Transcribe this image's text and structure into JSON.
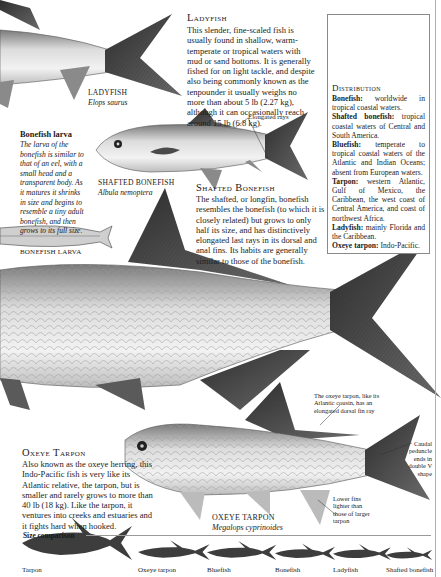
{
  "ladyfish": {
    "heading": "Ladyfish",
    "body": "This slender, fine-scaled fish is usually found in shallow, warm-temperate or tropical waters with mud or sand bottoms. It is generally fished for on light tackle, and despite also being commonly known as the tenpounder it usually weighs no more than about 5 lb (2.27 kg), although it can occasionally reach around 15 lb (6.8 kg).",
    "label": "LADYFISH",
    "scientific": "Elops saurus"
  },
  "bonefish_larva": {
    "heading": "Bonefish larva",
    "body": "The larva of the bonefish is similar to that of an eel, with a small head and a transparent body. As it matures it shrinks in size and begins to resemble a tiny adult bonefish, and then grows to its full size.",
    "label": "BONEFISH LARVA"
  },
  "shafted_bonefish": {
    "label": "SHAFTED BONEFISH",
    "scientific": "Albula nemoptera",
    "callout": "Elongated rays",
    "heading": "Shafted Bonefish",
    "body": "The shafted, or longfin, bonefish resembles the bonefish (to which it is closely related) but grows to only half its size, and has distinctively elongated last rays in its dorsal and anal fins. Its habits are generally similar to those of the bonefish."
  },
  "distribution": {
    "heading": "Distribution",
    "items": [
      {
        "name": "Bonefish:",
        "text": "worldwide in tropical coastal waters."
      },
      {
        "name": "Shafted bonefish:",
        "text": "tropical coastal waters of Central and South America."
      },
      {
        "name": "Bluefish:",
        "text": "temperate to tropical coastal waters of the Atlantic and Indian Oceans; absent from European waters."
      },
      {
        "name": "Tarpon:",
        "text": "western Atlantic, Gulf of Mexico, the Caribbean, the west coast of Central America, and coast of northwest Africa."
      },
      {
        "name": "Ladyfish:",
        "text": "mainly Florida and the Caribbean."
      },
      {
        "name": "Oxeye tarpon:",
        "text": "Indo-Pacific."
      }
    ]
  },
  "oxeye_tarpon": {
    "heading": "Oxeye Tarpon",
    "body": "Also known as the oxeye herring, this Indo-Pacific fish is very like its Atlantic relative, the tarpon, but is smaller and rarely grows to more than 40 lb (18 kg). Like the tarpon, it ventures into creeks and estuaries and it fights hard when hooked.",
    "label": "OXEYE TARPON",
    "scientific": "Megalops cyprinoides",
    "callout_dorsal": "The oxeye tarpon, like its Atlantic cousin, has an elongated dorsal fin ray",
    "callout_caudal": "Caudal peduncle ends in double V shape",
    "callout_fins": "Lower fins lighter than those of larger tarpon"
  },
  "size_comparison": {
    "heading": "Size comparison",
    "fish": [
      {
        "name": "Tarpon",
        "relative_size": 1.0
      },
      {
        "name": "Oxeye tarpon",
        "relative_size": 0.62
      },
      {
        "name": "Bluefish",
        "relative_size": 0.6
      },
      {
        "name": "Bonefish",
        "relative_size": 0.52
      },
      {
        "name": "Ladyfish",
        "relative_size": 0.5
      },
      {
        "name": "Shafted bonefish",
        "relative_size": 0.4
      }
    ]
  },
  "colors": {
    "silhouette": "#3d3d3d",
    "fin_dark": "#4a4a4a",
    "body_light": "#d9d9d9"
  }
}
